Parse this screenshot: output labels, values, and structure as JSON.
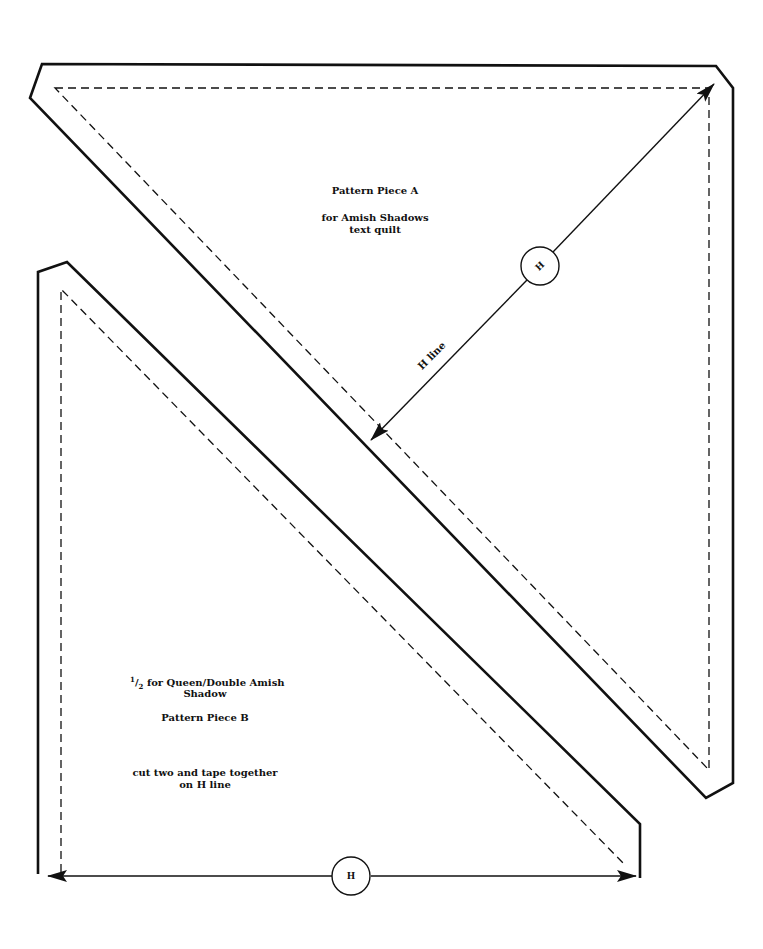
{
  "piece_a": {
    "title": "Pattern Piece A",
    "subtitle_line1": "for Amish Shadows",
    "subtitle_line2": "text quilt",
    "h_line_label": "H line",
    "h_marker": "H"
  },
  "piece_b": {
    "fraction_num": "1",
    "fraction_den": "2",
    "line1": "for Queen/Double Amish",
    "line2": "Shadow",
    "title": "Pattern Piece B",
    "instr_line1": "cut two and tape together",
    "instr_line2": "on H line",
    "h_marker": "H"
  },
  "colors": {
    "ink": "#111111",
    "paper": "#ffffff"
  }
}
